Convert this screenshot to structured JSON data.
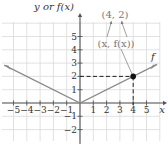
{
  "chart_data": {
    "type": "line",
    "title": "",
    "xlabel": "x",
    "ylabel": "y or f(x)",
    "function_label": "f",
    "function": "f(x) = |x| / 2",
    "xlim": [
      -5.8,
      6.4
    ],
    "ylim": [
      -2.8,
      7.5
    ],
    "grid": true,
    "x_ticks": [
      -5,
      -4,
      -3,
      -2,
      -1,
      1,
      2,
      3,
      4,
      5
    ],
    "y_ticks": [
      -2,
      -1,
      1,
      2,
      3,
      4,
      5
    ],
    "series": [
      {
        "name": "f",
        "x": [
          -5.7,
          0,
          5.8
        ],
        "y": [
          2.85,
          0,
          2.9
        ]
      }
    ],
    "highlighted_point": {
      "x": 4,
      "y": 2,
      "label": "(4, 2)"
    },
    "annotations": [
      {
        "text": "(4, 2)",
        "position": "top"
      },
      {
        "text": "(x, f(x))",
        "position": "below (4, 2), arrows pointing up to each coordinate"
      }
    ],
    "colors": {
      "grid": "#d9d9d9",
      "axis": "#555555",
      "curve": "#8a8a8a",
      "point": "#111111",
      "dashed": "#222222",
      "annotation": "#777777"
    }
  },
  "labels": {
    "y_axis": "y or f(x)",
    "x_axis": "x",
    "function": "f",
    "point_label": "(4, 2)",
    "generic_label": "(x, f(x))",
    "x_tick_labels": [
      "−5",
      "−4",
      "−3",
      "−2",
      "−1",
      "1",
      "2",
      "3",
      "4",
      "5"
    ],
    "y_tick_labels": [
      "5",
      "4",
      "3",
      "2",
      "1",
      "−1",
      "−2"
    ]
  }
}
